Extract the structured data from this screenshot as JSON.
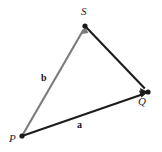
{
  "figure": {
    "background_color": "#ffffff",
    "width": 162,
    "height": 152
  },
  "vertices": [
    {
      "id": "P",
      "label": "P",
      "x": 22,
      "y": 136,
      "dot_color": "#1a1a1a",
      "label_position": "left"
    },
    {
      "id": "S",
      "label": "S",
      "x": 85,
      "y": 26,
      "dot_color": "#1a1a1a",
      "label_position": "above"
    },
    {
      "id": "Q",
      "label": "Q",
      "x": 148,
      "y": 92,
      "dot_color": "#1a1a1a",
      "label_position": "below-left"
    }
  ],
  "vectors": [
    {
      "id": "a",
      "label": "a",
      "from": "P",
      "to": "Q",
      "color": "#1c1c1c",
      "arrowhead": "at-Q",
      "label_x": 80,
      "label_y": 125
    },
    {
      "id": "b",
      "label": "b",
      "from": "P",
      "to": "S",
      "color": "#7b7b7b",
      "arrowhead": "at-S",
      "label_x": 45,
      "label_y": 78
    },
    {
      "id": "sq",
      "label": "",
      "from": "S",
      "to": "Q",
      "color": "#1c1c1c",
      "arrowhead": "at-Q",
      "label_x": null,
      "label_y": null
    }
  ],
  "labels": {
    "vertex_P": "P",
    "vertex_S": "S",
    "vertex_Q": "Q",
    "magnitude_a": "a",
    "magnitude_b": "b"
  },
  "colors": {
    "black_line": "#1c1c1c",
    "gray_line": "#7b7b7b",
    "dot": "#1a1a1a",
    "text": "#1c1c1c",
    "background": "#ffffff"
  }
}
